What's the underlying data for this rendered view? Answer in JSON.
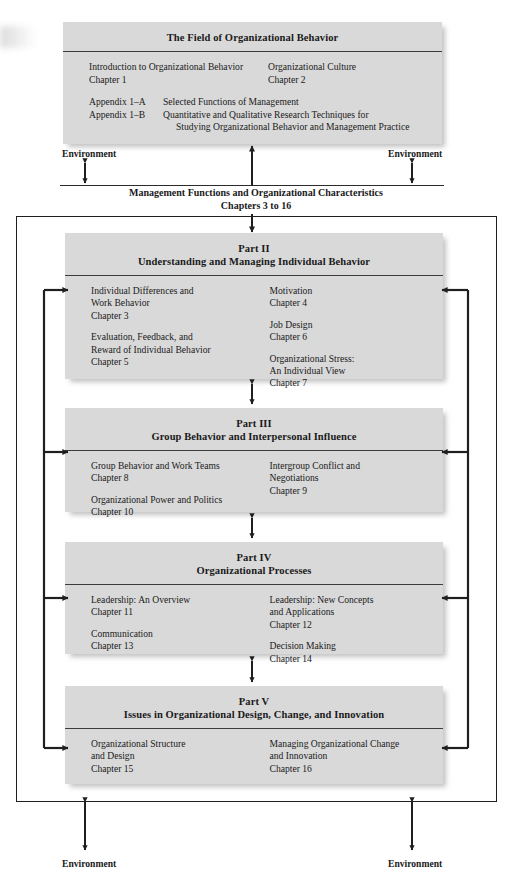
{
  "diagram": {
    "title_box": {
      "heading": "The Field of Organizational Behavior",
      "left_entry": {
        "title": "Introduction to Organizational Behavior",
        "chapter": "Chapter 1"
      },
      "right_entry": {
        "title": "Organizational Culture",
        "chapter": "Chapter 2"
      },
      "appendices": [
        {
          "label": "Appendix 1–A",
          "text": "Selected Functions of Management"
        },
        {
          "label": "Appendix 1–B",
          "text": "Quantitative and Qualitative Research Techniques for",
          "continuation": "Studying Organizational Behavior and Management Practice"
        }
      ]
    },
    "center_band": {
      "line1": "Management Functions and Organizational Characteristics",
      "line2": "Chapters 3 to 16"
    },
    "environment_labels": {
      "top_left": "Environment",
      "top_right": "Environment",
      "bottom_left": "Environment",
      "bottom_right": "Environment"
    },
    "parts": [
      {
        "part_label": "Part II",
        "part_title": "Understanding and Managing Individual Behavior",
        "left_column": [
          {
            "lines": [
              "Individual Differences and",
              "Work Behavior"
            ],
            "chapter": "Chapter 3"
          },
          {
            "lines": [
              "Evaluation, Feedback, and",
              "Reward of Individual Behavior"
            ],
            "chapter": "Chapter 5"
          }
        ],
        "right_column": [
          {
            "lines": [
              "Motivation"
            ],
            "chapter": "Chapter 4"
          },
          {
            "lines": [
              "Job Design"
            ],
            "chapter": "Chapter 6"
          },
          {
            "lines": [
              "Organizational Stress:",
              "An Individual View"
            ],
            "chapter": "Chapter 7"
          }
        ]
      },
      {
        "part_label": "Part III",
        "part_title": "Group Behavior and Interpersonal Influence",
        "left_column": [
          {
            "lines": [
              "Group Behavior and Work Teams"
            ],
            "chapter": "Chapter 8"
          },
          {
            "lines": [
              "Organizational Power and Politics"
            ],
            "chapter": "Chapter 10"
          }
        ],
        "right_column": [
          {
            "lines": [
              "Intergroup Conflict and",
              "Negotiations"
            ],
            "chapter": "Chapter 9"
          }
        ]
      },
      {
        "part_label": "Part IV",
        "part_title": "Organizational Processes",
        "left_column": [
          {
            "lines": [
              "Leadership: An Overview"
            ],
            "chapter": "Chapter 11"
          },
          {
            "lines": [
              "Communication"
            ],
            "chapter": "Chapter 13"
          }
        ],
        "right_column": [
          {
            "lines": [
              "Leadership: New Concepts",
              "and Applications"
            ],
            "chapter": "Chapter 12"
          },
          {
            "lines": [
              "Decision Making"
            ],
            "chapter": "Chapter 14"
          }
        ]
      },
      {
        "part_label": "Part V",
        "part_title": "Issues in Organizational Design, Change, and Innovation",
        "left_column": [
          {
            "lines": [
              "Organizational Structure",
              "and Design"
            ],
            "chapter": "Chapter 15"
          }
        ],
        "right_column": [
          {
            "lines": [
              "Managing Organizational Change",
              "and Innovation"
            ],
            "chapter": "Chapter 16"
          }
        ]
      }
    ],
    "colors": {
      "panel_fill": "#d9d9d9",
      "rule": "#3c3c3c",
      "stroke": "#1f1f1f",
      "page": "#ffffff"
    }
  }
}
